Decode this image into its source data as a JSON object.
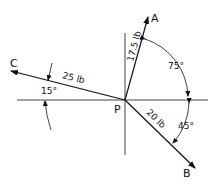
{
  "diagram": {
    "origin_label": "P",
    "forces": [
      {
        "id": "A",
        "label": "A",
        "magnitude_label": "17.5 lb",
        "angle_deg": 75
      },
      {
        "id": "B",
        "label": "B",
        "magnitude_label": "20 lb",
        "angle_deg": -45
      },
      {
        "id": "C",
        "label": "C",
        "magnitude_label": "25 lb",
        "angle_deg": 165
      }
    ],
    "angles": [
      {
        "label": "75°",
        "between": "A and +x axis"
      },
      {
        "label": "45°",
        "between": "B and +x axis"
      },
      {
        "label": "15°",
        "between": "C and -x axis"
      }
    ]
  }
}
